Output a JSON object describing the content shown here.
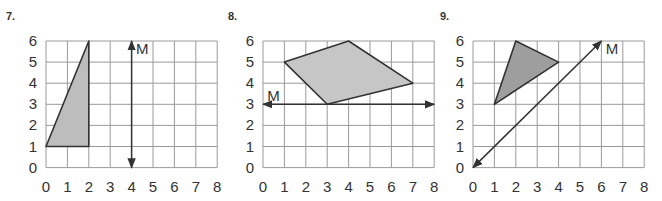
{
  "problems": [
    {
      "number": "7.",
      "x_ticks": [
        "0",
        "1",
        "2",
        "3",
        "4",
        "5",
        "6",
        "7",
        "8"
      ],
      "y_ticks": [
        "0",
        "1",
        "2",
        "3",
        "4",
        "5",
        "6"
      ],
      "shape": {
        "type": "triangle",
        "vertices": [
          [
            0,
            1
          ],
          [
            2,
            6
          ],
          [
            2,
            1
          ]
        ],
        "fill": "#bdbdbd"
      },
      "mirror_line": {
        "label": "M",
        "from": [
          4,
          0
        ],
        "to": [
          4,
          6
        ],
        "label_at": [
          4.2,
          5.6
        ]
      }
    },
    {
      "number": "8.",
      "x_ticks": [
        "0",
        "1",
        "2",
        "3",
        "4",
        "5",
        "6",
        "7",
        "8"
      ],
      "y_ticks": [
        "0",
        "1",
        "2",
        "3",
        "4",
        "5",
        "6"
      ],
      "shape": {
        "type": "quadrilateral",
        "vertices": [
          [
            1,
            5
          ],
          [
            4,
            6
          ],
          [
            7,
            4
          ],
          [
            3,
            3
          ]
        ],
        "fill": "#c6c6c6"
      },
      "mirror_line": {
        "label": "M",
        "from": [
          0,
          3
        ],
        "to": [
          8,
          3
        ],
        "label_at": [
          0.2,
          3.4
        ]
      }
    },
    {
      "number": "9.",
      "x_ticks": [
        "0",
        "1",
        "2",
        "3",
        "4",
        "5",
        "6",
        "7",
        "8"
      ],
      "y_ticks": [
        "0",
        "1",
        "2",
        "3",
        "4",
        "5",
        "6"
      ],
      "shape": {
        "type": "triangle",
        "vertices": [
          [
            2,
            6
          ],
          [
            4,
            5
          ],
          [
            1,
            3
          ]
        ],
        "fill": "#9e9e9e"
      },
      "mirror_line": {
        "label": "M",
        "from": [
          0,
          0
        ],
        "to": [
          6,
          6
        ],
        "label_at": [
          6.2,
          5.6
        ]
      }
    }
  ]
}
